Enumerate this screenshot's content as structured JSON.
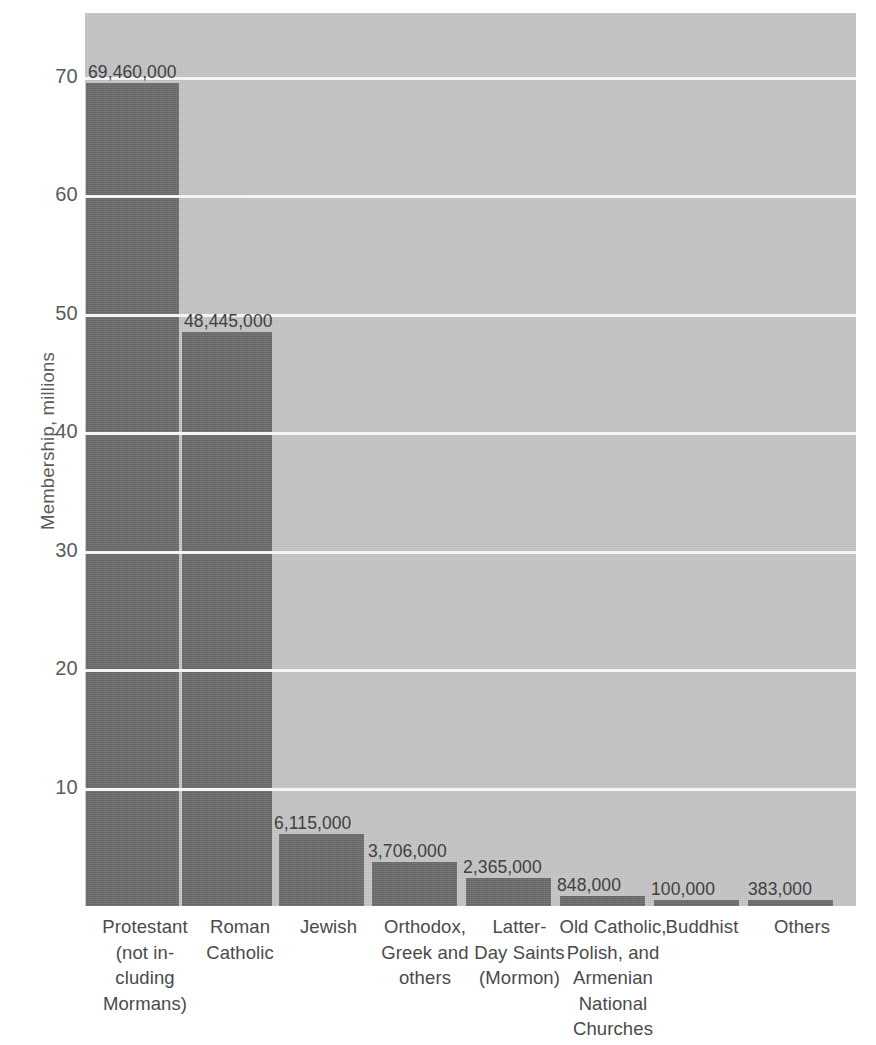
{
  "chart_data": {
    "type": "bar",
    "title": "",
    "xlabel": "",
    "ylabel": "Membership, millions",
    "ylim": [
      0,
      75
    ],
    "grid": true,
    "legend": "none",
    "yticks": [
      10,
      20,
      30,
      40,
      50,
      60,
      70
    ],
    "ytick_labels": [
      "10",
      "20",
      "30",
      "40",
      "50",
      "60",
      "70"
    ],
    "categories": [
      "Protestant (not in-cluding Mormans)",
      "Roman Catholic",
      "Jewish",
      "Orthodox, Greek and others",
      "Latter-Day Saints (Mormon)",
      "Old Catholic, Polish, and Armenian National Churches",
      "Buddhist",
      "Others"
    ],
    "category_lines": [
      [
        "Protestant",
        "(not in-",
        "cluding",
        "Mormans)"
      ],
      [
        "Roman",
        "Catholic"
      ],
      [
        "Jewish"
      ],
      [
        "Orthodox,",
        "Greek and",
        "others"
      ],
      [
        "Latter-",
        "Day Saints",
        "(Mormon)"
      ],
      [
        "Old Catholic,",
        "Polish, and",
        "Armenian",
        "National",
        "Churches"
      ],
      [
        "Buddhist"
      ],
      [
        "Others"
      ]
    ],
    "values": [
      69460000,
      48445000,
      6115000,
      3706000,
      2365000,
      848000,
      100000,
      383000
    ],
    "value_labels": [
      "69,460,000",
      "48,445,000",
      "6,115,000",
      "3,706,000",
      "2,365,000",
      "848,000",
      "100,000",
      "383,000"
    ],
    "value_units": "millions",
    "colors": {
      "bar": "#6d6d6d",
      "plot_background": "#c6c6c6",
      "gridline": "#f4f4f4",
      "text": "#4a4a4a",
      "page_background": "#ffffff"
    }
  },
  "title_remnant": "...",
  "geometry": {
    "plot_left": 85,
    "plot_top": 13,
    "plot_width": 771,
    "plot_height": 893,
    "baseline_y": 906,
    "px_per_million": 11.85,
    "bars": [
      {
        "left": 1,
        "width": 93
      },
      {
        "left": 97,
        "width": 90
      },
      {
        "left": 194,
        "width": 85
      },
      {
        "left": 287,
        "width": 85
      },
      {
        "left": 381,
        "width": 85
      },
      {
        "left": 475,
        "width": 85
      },
      {
        "left": 569,
        "width": 85
      },
      {
        "left": 663,
        "width": 85
      }
    ],
    "value_label_positions": [
      {
        "left": 88,
        "bottom_offset": 832
      },
      {
        "left": 184,
        "bottom_offset": 583
      },
      {
        "left": 274,
        "bottom_offset": 78
      },
      {
        "left": 368,
        "bottom_offset": 50
      },
      {
        "left": 463,
        "bottom_offset": 34
      },
      {
        "left": 557,
        "bottom_offset": 15
      },
      {
        "left": 651,
        "bottom_offset": 10
      },
      {
        "left": 748,
        "bottom_offset": 12
      }
    ],
    "xcat_positions": [
      {
        "left": 4,
        "width": 112
      },
      {
        "left": 105,
        "width": 100
      },
      {
        "left": 196,
        "width": 95
      },
      {
        "left": 284,
        "width": 112
      },
      {
        "left": 382,
        "width": 105
      },
      {
        "left": 472,
        "width": 112
      },
      {
        "left": 572,
        "width": 90
      },
      {
        "left": 672,
        "width": 90
      }
    ]
  }
}
